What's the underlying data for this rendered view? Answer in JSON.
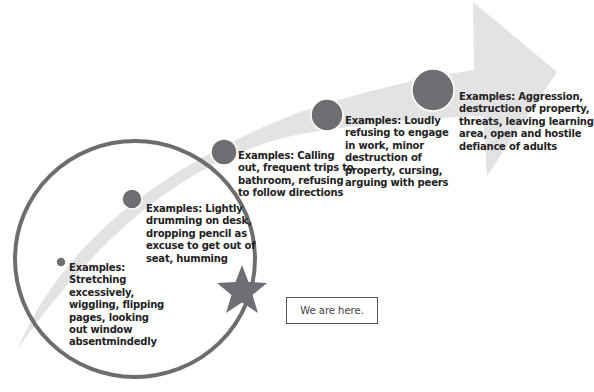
{
  "diagram": {
    "type": "escalation-arrow",
    "colors": {
      "arrow_fill": "#e3e3e4",
      "dot_fill": "#716e73",
      "dot_rim": "#ffffff",
      "circle_outline": "#6f6c71",
      "star_fill": "#706d75",
      "text": "#222222",
      "box_border": "#555555"
    },
    "stages": [
      {
        "level": 1,
        "dot": {
          "cx": 61,
          "cy": 262,
          "r": 5
        },
        "lines": [
          "Examples:",
          "Stretching",
          "excessively,",
          "wiggling, flipping",
          "pages, looking",
          "out window",
          "absentmindedly"
        ]
      },
      {
        "level": 2,
        "dot": {
          "cx": 132,
          "cy": 199,
          "r": 10
        },
        "lines": [
          "Examples: Lightly",
          "drumming on desk,",
          "dropping pencil as",
          "excuse to get out of",
          "seat, humming"
        ]
      },
      {
        "level": 3,
        "dot": {
          "cx": 224,
          "cy": 152,
          "r": 13
        },
        "lines": [
          "Examples: Calling",
          "out, frequent trips to",
          "bathroom, refusing",
          "to follow directions"
        ]
      },
      {
        "level": 4,
        "dot": {
          "cx": 327,
          "cy": 115,
          "r": 16
        },
        "lines": [
          "Examples: Loudly",
          "refusing to engage",
          "in work, minor",
          "destruction of",
          "property, cursing,",
          "arguing with peers"
        ]
      },
      {
        "level": 5,
        "dot": {
          "cx": 433,
          "cy": 90,
          "r": 21
        },
        "lines": [
          "Examples: Aggression,",
          "destruction of property,",
          "threats, leaving learning",
          "area, open and hostile",
          "defiance of adults"
        ]
      }
    ],
    "highlight": {
      "circle": {
        "cx": 135,
        "cy": 259,
        "rx": 120,
        "ry": 118
      },
      "star": {
        "cx": 242,
        "cy": 291
      }
    },
    "callout": {
      "label": "We are here."
    }
  }
}
